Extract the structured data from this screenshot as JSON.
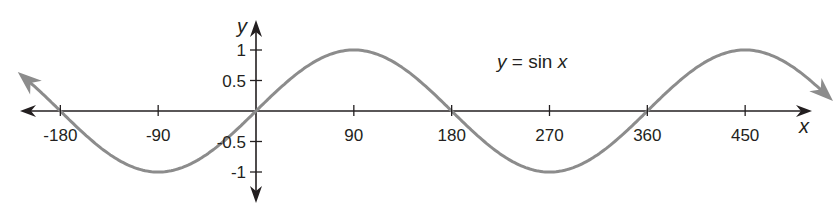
{
  "chart_data": {
    "type": "line",
    "title": "",
    "xlabel": "x",
    "ylabel": "y",
    "annotation": {
      "text_var": "y",
      "text_eq": " = sin ",
      "text_arg": "x"
    },
    "x_ticks": [
      -180,
      -90,
      90,
      180,
      270,
      360,
      450
    ],
    "x_tick_labels": [
      "-180",
      "-90",
      "90",
      "180",
      "270",
      "360",
      "450"
    ],
    "y_ticks": [
      1,
      0.5,
      -0.5,
      -1
    ],
    "y_tick_labels": [
      "1",
      "0.5",
      "-0.5",
      "-1"
    ],
    "xlim": [
      -200,
      565
    ],
    "ylim": [
      -1.2,
      1.2
    ],
    "grid": false,
    "legend": "none",
    "series": [
      {
        "name": "y = sin x",
        "function": "sin(x degrees)",
        "x": [
          -210,
          -180,
          -135,
          -90,
          -45,
          0,
          45,
          90,
          135,
          180,
          225,
          270,
          315,
          360,
          405,
          450,
          495,
          525
        ],
        "values": [
          0.5,
          0,
          -0.707,
          -1,
          -0.707,
          0,
          0.707,
          1,
          0.707,
          0,
          -0.707,
          -1,
          -0.707,
          0,
          0.707,
          1,
          0.707,
          0.5
        ],
        "color": "#8c8c8c",
        "arrows_both_ends": true
      }
    ],
    "axis_color": "#231f20"
  },
  "layout": {
    "origin_px": [
      256,
      111
    ],
    "px_per_degree": 1.087,
    "px_per_unit_y": 61,
    "x_axis_left": 20,
    "x_axis_right": 812,
    "y_axis_top": 20,
    "y_axis_bottom": 203
  }
}
